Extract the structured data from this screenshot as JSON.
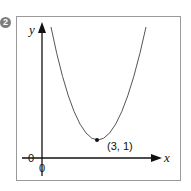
{
  "problem_number": "2",
  "axes": {
    "x_label": "x",
    "y_label": "y",
    "origin_x_label": "0",
    "origin_y_label": "0"
  },
  "point": {
    "label": "(3, 1)",
    "x": 3,
    "y": 1
  },
  "curve": {
    "type": "parabola",
    "vertex": "(3, 1)",
    "opens": "up"
  },
  "colors": {
    "curve": "#555555",
    "axis": "#111111",
    "frame": "#999999",
    "badge": "#7d7d7d"
  }
}
